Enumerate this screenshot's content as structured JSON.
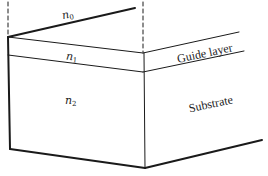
{
  "diagram": {
    "regions": [
      {
        "id": "cover",
        "index_symbol": "n",
        "index_subscript": "0"
      },
      {
        "id": "guide",
        "index_symbol": "n",
        "index_subscript": "1",
        "label": "Guide layer"
      },
      {
        "id": "substrate",
        "index_symbol": "n",
        "index_subscript": "2",
        "label": "Substrate"
      }
    ],
    "colors": {
      "line": "#1a1a1a",
      "background": "#ffffff"
    }
  }
}
